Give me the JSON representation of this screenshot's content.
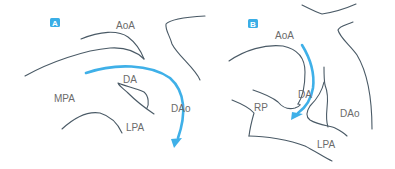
{
  "panels": [
    {
      "badge": "A",
      "labels": {
        "aoa": "AoA",
        "da": "DA",
        "mpa": "MPA",
        "dao": "DAo",
        "lpa": "LPA"
      }
    },
    {
      "badge": "B",
      "labels": {
        "aoa": "AoA",
        "da": "DA",
        "rp": "RP",
        "dao": "DAo",
        "lpa": "LPA"
      }
    }
  ],
  "colors": {
    "outline": "#4a5a66",
    "flow_arrow": "#3fb0e8",
    "badge": "#3aaee6",
    "label": "#6b6b6b"
  }
}
